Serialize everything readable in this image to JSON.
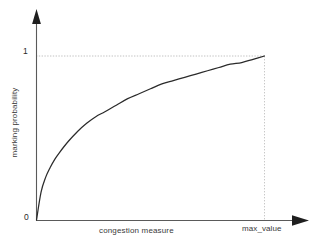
{
  "chart_data": {
    "type": "line",
    "title": "",
    "subtitle": "",
    "xlabel": "congestion measure",
    "ylabel": "marking probability",
    "grid": false,
    "legend": null,
    "legend_position": "none",
    "x_tick_labels": [
      "max_value"
    ],
    "y_tick_labels": [
      "0",
      "1"
    ],
    "origin_label": "0",
    "y_max_label": "1",
    "x_max_label": "max_value",
    "xlim": [
      0,
      1
    ],
    "ylim": [
      0,
      1
    ],
    "axis_arrows": true,
    "annotations": [
      {
        "name": "y-one-guide",
        "type": "dotted-horizontal",
        "value": 1
      },
      {
        "name": "x-max-guide",
        "type": "dotted-vertical",
        "value": 1
      }
    ],
    "series": [
      {
        "name": "marking probability curve",
        "color": "#2b2b2b",
        "x": [
          0.0,
          0.02,
          0.04,
          0.06,
          0.08,
          0.1,
          0.14,
          0.18,
          0.22,
          0.26,
          0.3,
          0.35,
          0.4,
          0.45,
          0.5,
          0.55,
          0.6,
          0.65,
          0.7,
          0.75,
          0.8,
          0.85,
          0.9,
          0.95,
          1.0
        ],
        "y": [
          0.0,
          0.17,
          0.26,
          0.32,
          0.37,
          0.41,
          0.48,
          0.54,
          0.59,
          0.63,
          0.66,
          0.7,
          0.74,
          0.77,
          0.8,
          0.83,
          0.85,
          0.87,
          0.89,
          0.91,
          0.93,
          0.95,
          0.96,
          0.98,
          1.0
        ]
      }
    ]
  },
  "colors": {
    "curve": "#2b2b2b",
    "axis": "#555555",
    "guide": "#c8c8c8",
    "text": "#333333",
    "background": "#ffffff"
  },
  "axes": {
    "y_axis_name": "marking-probability-axis",
    "x_axis_name": "congestion-measure-axis"
  }
}
